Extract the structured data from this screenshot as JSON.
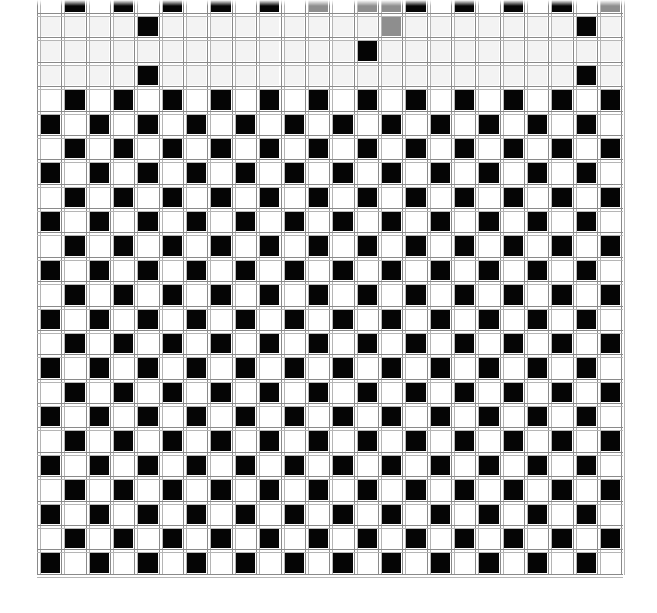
{
  "image": {
    "title": "",
    "description": "checkerboard pattern with gridlines, top rows partially faded"
  },
  "grid": {
    "cols": 24,
    "rows_first": -1,
    "rows_last": 22,
    "origin_x": 38,
    "origin_y": 14,
    "cell_w": 24.35,
    "cell_h": 24.38,
    "black_parity": "even",
    "colors": {
      "black": "#050505",
      "white": "#ffffff",
      "faded": "#f3f3f3",
      "gray": "#8e8e8e",
      "gridline": "#8a8a8a"
    },
    "faded_rows": [
      0,
      1,
      2
    ],
    "kept_black_in_faded_rows": [
      {
        "row": 0,
        "col": 4
      },
      {
        "row": 0,
        "col": 22
      },
      {
        "row": 1,
        "col": 13
      },
      {
        "row": 2,
        "col": 4
      },
      {
        "row": 2,
        "col": 22
      }
    ],
    "gray_cells": [
      {
        "row": -1,
        "col": 11
      },
      {
        "row": -1,
        "col": 13
      },
      {
        "row": -1,
        "col": 14
      },
      {
        "row": 0,
        "col": 14
      },
      {
        "row": -1,
        "col": 23
      }
    ],
    "white_cells_override": [
      {
        "row": 22,
        "col": 23
      }
    ]
  }
}
